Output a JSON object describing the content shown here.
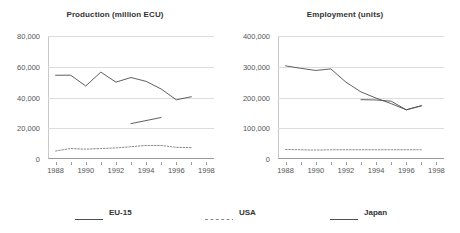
{
  "colors": {
    "line": "#4d4d4d",
    "grid": "#dcdcdc",
    "axis": "#9a9a9a",
    "text": "#555555",
    "title": "#333333"
  },
  "legend": {
    "items": [
      {
        "label": "EU-15",
        "style": "solid",
        "color": "#4d4d4d"
      },
      {
        "label": "USA",
        "style": "dashed",
        "color": "#8a8a8a"
      },
      {
        "label": "Japan",
        "style": "solid",
        "color": "#4d4d4d"
      }
    ]
  },
  "chart_data": [
    {
      "type": "line",
      "title": "Production (million ECU)",
      "xlabel": "",
      "ylabel": "",
      "xlim": [
        1987.5,
        1998.5
      ],
      "ylim": [
        0,
        80000
      ],
      "xticks": [
        1988,
        1990,
        1992,
        1994,
        1996,
        1998
      ],
      "xticklabels": [
        "1988",
        "1990",
        "1992",
        "1994",
        "1996",
        "1998"
      ],
      "xminorticks": [
        1989,
        1991,
        1993,
        1995,
        1997
      ],
      "yticks": [
        0,
        20000,
        40000,
        60000,
        80000
      ],
      "yticklabels": [
        "0",
        "20,000",
        "40,000",
        "60,000",
        "80,000"
      ],
      "grid": true,
      "legend_position": "bottom",
      "series": [
        {
          "name": "EU-15",
          "style": "solid",
          "x": [
            1988,
            1989,
            1990,
            1991,
            1992,
            1993,
            1994,
            1995,
            1996,
            1997
          ],
          "values": [
            54500,
            54500,
            47500,
            56500,
            50000,
            53000,
            50500,
            45500,
            38500,
            40500
          ]
        },
        {
          "name": "USA",
          "style": "dashed",
          "x": [
            1988,
            1989,
            1990,
            1991,
            1992,
            1993,
            1994,
            1995,
            1996,
            1997
          ],
          "values": [
            5200,
            6800,
            6400,
            6800,
            7200,
            8000,
            8800,
            8800,
            7600,
            7400
          ]
        },
        {
          "name": "Japan",
          "style": "solid",
          "x": [
            1993,
            1995
          ],
          "values": [
            23000,
            27000
          ]
        }
      ]
    },
    {
      "type": "line",
      "title": "Employment (units)",
      "xlabel": "",
      "ylabel": "",
      "xlim": [
        1987.5,
        1998.5
      ],
      "ylim": [
        0,
        400000
      ],
      "xticks": [
        1988,
        1990,
        1992,
        1994,
        1996,
        1998
      ],
      "xticklabels": [
        "1988",
        "1990",
        "1992",
        "1994",
        "1996",
        "1998"
      ],
      "xminorticks": [
        1989,
        1991,
        1993,
        1995,
        1997
      ],
      "yticks": [
        0,
        100000,
        200000,
        300000,
        400000
      ],
      "yticklabels": [
        "0",
        "100,000",
        "200,000",
        "300,000",
        "400,000"
      ],
      "grid": true,
      "legend_position": "bottom",
      "series": [
        {
          "name": "EU-15",
          "style": "solid",
          "x": [
            1988,
            1989,
            1990,
            1991,
            1992,
            1993,
            1994,
            1995,
            1996,
            1997
          ],
          "values": [
            303000,
            295000,
            288000,
            293000,
            250000,
            218000,
            198000,
            180000,
            160000,
            173000
          ]
        },
        {
          "name": "USA",
          "style": "dashed",
          "x": [
            1988,
            1989,
            1990,
            1991,
            1992,
            1993,
            1994,
            1995,
            1996,
            1997
          ],
          "values": [
            31000,
            30000,
            29000,
            30000,
            30000,
            30000,
            30000,
            30000,
            30000,
            30000
          ]
        },
        {
          "name": "Japan",
          "style": "solid",
          "x": [
            1993,
            1994,
            1995,
            1996,
            1997
          ],
          "values": [
            193000,
            192000,
            188000,
            160000,
            173000
          ]
        }
      ]
    }
  ]
}
